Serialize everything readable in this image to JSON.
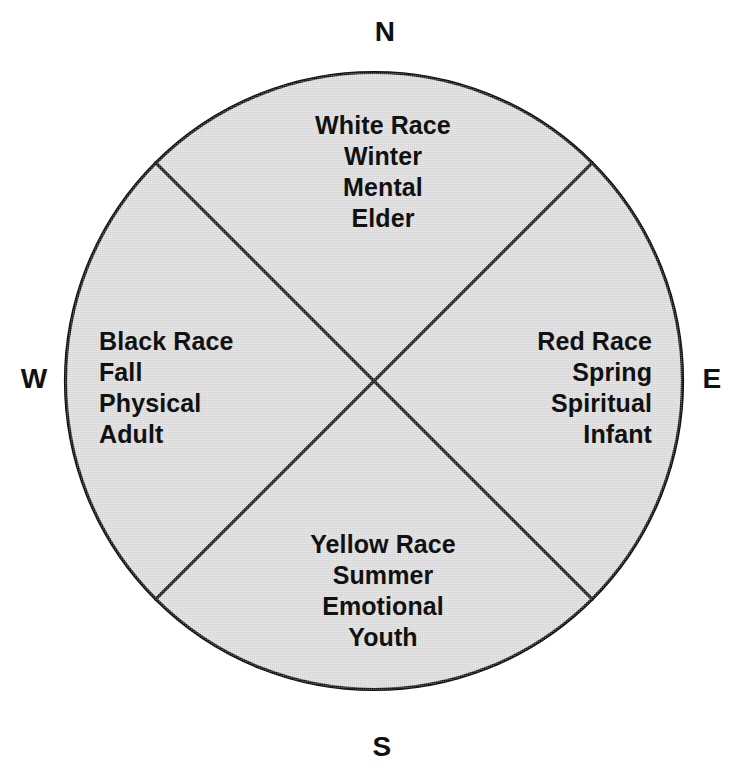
{
  "diagram": {
    "background_color": "#ffffff",
    "circle_fill_color": "#dbdbdb",
    "stroke_color": "#111111"
  },
  "cardinals": {
    "north": "N",
    "east": "E",
    "south": "S",
    "west": "W"
  },
  "quadrants": {
    "north": {
      "lines": [
        "White Race",
        "Winter",
        "Mental",
        "Elder"
      ],
      "race": "White Race",
      "season": "Winter",
      "aspect": "Mental",
      "life_stage": "Elder"
    },
    "east": {
      "lines": [
        "Red Race",
        "Spring",
        "Spiritual",
        "Infant"
      ],
      "race": "Red Race",
      "season": "Spring",
      "aspect": "Spiritual",
      "life_stage": "Infant"
    },
    "south": {
      "lines": [
        "Yellow Race",
        "Summer",
        "Emotional",
        "Youth"
      ],
      "race": "Yellow Race",
      "season": "Summer",
      "aspect": "Emotional",
      "life_stage": "Youth"
    },
    "west": {
      "lines": [
        "Black Race",
        "Fall",
        "Physical",
        "Adult"
      ],
      "race": "Black Race",
      "season": "Fall",
      "aspect": "Physical",
      "life_stage": "Adult"
    }
  }
}
